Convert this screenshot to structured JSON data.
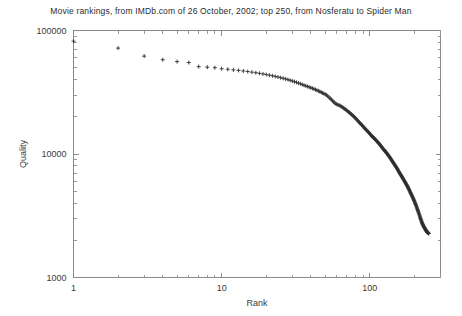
{
  "chart_data": {
    "type": "scatter",
    "title": "Movie rankings, from IMDb.com of 26 October, 2002; top 250, from Nosferatu to Spider Man",
    "xlabel": "Rank",
    "ylabel": "Quality",
    "xscale": "log",
    "yscale": "log",
    "xlim": [
      1,
      300
    ],
    "ylim": [
      1000,
      100000
    ],
    "xticks": [
      1,
      10,
      100
    ],
    "xtick_labels": [
      "1",
      "10",
      "100"
    ],
    "yticks": [
      1000,
      10000,
      100000
    ],
    "ytick_labels": [
      "1000",
      "10000",
      "100000"
    ],
    "grid": false,
    "legend": false,
    "marker": "plus",
    "marker_color": "#2e2e2e",
    "series_name": "Quality vs Rank",
    "x": [
      1,
      2,
      3,
      4,
      5,
      6,
      7,
      8,
      9,
      10,
      11,
      12,
      13,
      14,
      15,
      16,
      17,
      18,
      19,
      20,
      21,
      22,
      23,
      24,
      25,
      26,
      27,
      28,
      29,
      30,
      31,
      32,
      33,
      34,
      35,
      36,
      37,
      38,
      39,
      40,
      41,
      42,
      43,
      44,
      45,
      46,
      47,
      48,
      49,
      50,
      51,
      52,
      53,
      54,
      55,
      56,
      57,
      58,
      59,
      60,
      61,
      62,
      63,
      64,
      65,
      66,
      67,
      68,
      69,
      70,
      71,
      72,
      73,
      74,
      75,
      76,
      77,
      78,
      79,
      80,
      81,
      82,
      83,
      84,
      85,
      86,
      87,
      88,
      89,
      90,
      91,
      92,
      93,
      94,
      95,
      96,
      97,
      98,
      99,
      100,
      101,
      102,
      103,
      104,
      105,
      106,
      107,
      108,
      109,
      110,
      111,
      112,
      113,
      114,
      115,
      116,
      117,
      118,
      119,
      120,
      121,
      122,
      123,
      124,
      125,
      126,
      127,
      128,
      129,
      130,
      131,
      132,
      133,
      134,
      135,
      136,
      137,
      138,
      139,
      140,
      141,
      142,
      143,
      144,
      145,
      146,
      147,
      148,
      149,
      150,
      151,
      152,
      153,
      154,
      155,
      156,
      157,
      158,
      159,
      160,
      161,
      162,
      163,
      164,
      165,
      166,
      167,
      168,
      169,
      170,
      171,
      172,
      173,
      174,
      175,
      176,
      177,
      178,
      179,
      180,
      181,
      182,
      183,
      184,
      185,
      186,
      187,
      188,
      189,
      190,
      191,
      192,
      193,
      194,
      195,
      196,
      197,
      198,
      199,
      200,
      201,
      202,
      203,
      204,
      205,
      206,
      207,
      208,
      209,
      210,
      211,
      212,
      213,
      214,
      215,
      216,
      217,
      218,
      219,
      220,
      221,
      222,
      223,
      224,
      225,
      226,
      227,
      228,
      229,
      230,
      231,
      232,
      233,
      234,
      235,
      236,
      237,
      238,
      239,
      240,
      241,
      242,
      243,
      244,
      245,
      246,
      247,
      248,
      249,
      250
    ],
    "y": [
      82000,
      72000,
      62000,
      58000,
      56000,
      55000,
      51000,
      50500,
      50000,
      49000,
      48500,
      48000,
      47500,
      47000,
      46500,
      46000,
      45500,
      45000,
      44500,
      44000,
      43500,
      43000,
      42500,
      42000,
      41500,
      41000,
      40500,
      40000,
      39500,
      39000,
      38500,
      38000,
      37500,
      37000,
      36500,
      36000,
      35600,
      35200,
      34800,
      34400,
      34000,
      33600,
      33200,
      32800,
      32400,
      32000,
      31600,
      31200,
      30800,
      30400,
      30000,
      29400,
      28800,
      28200,
      27600,
      27000,
      26400,
      25900,
      25500,
      25200,
      25000,
      24800,
      24600,
      24300,
      24000,
      23700,
      23400,
      23100,
      22800,
      22500,
      22200,
      21900,
      21600,
      21300,
      21000,
      20700,
      20400,
      20100,
      19800,
      19500,
      19200,
      18900,
      18600,
      18300,
      18000,
      17750,
      17500,
      17250,
      17000,
      16750,
      16500,
      16250,
      16000,
      15800,
      15600,
      15400,
      15200,
      15000,
      14800,
      14600,
      14400,
      14200,
      14000,
      13850,
      13700,
      13550,
      13400,
      13250,
      13100,
      12950,
      12800,
      12650,
      12500,
      12350,
      12200,
      12050,
      11900,
      11750,
      11600,
      11450,
      11300,
      11150,
      11000,
      10880,
      10760,
      10640,
      10520,
      10400,
      10280,
      10160,
      10040,
      9920,
      9800,
      9680,
      9560,
      9440,
      9320,
      9200,
      9080,
      8960,
      8840,
      8720,
      8600,
      8500,
      8400,
      8300,
      8200,
      8100,
      8000,
      7900,
      7800,
      7700,
      7600,
      7500,
      7400,
      7300,
      7200,
      7100,
      7000,
      6920,
      6840,
      6760,
      6680,
      6600,
      6520,
      6440,
      6360,
      6280,
      6200,
      6130,
      6060,
      5990,
      5920,
      5850,
      5780,
      5710,
      5640,
      5570,
      5500,
      5430,
      5360,
      5290,
      5220,
      5150,
      5080,
      5010,
      4940,
      4870,
      4800,
      4740,
      4680,
      4620,
      4560,
      4500,
      4440,
      4380,
      4320,
      4260,
      4200,
      4140,
      4080,
      4020,
      3960,
      3900,
      3840,
      3780,
      3720,
      3660,
      3600,
      3545,
      3490,
      3435,
      3380,
      3325,
      3270,
      3215,
      3160,
      3105,
      3050,
      3000,
      2955,
      2910,
      2865,
      2820,
      2780,
      2745,
      2710,
      2680,
      2650,
      2620,
      2595,
      2570,
      2545,
      2520,
      2500,
      2480,
      2460,
      2440,
      2420,
      2400,
      2380,
      2360,
      2345,
      2330,
      2320,
      2310,
      2300,
      2290,
      2280,
      2270,
      2260,
      2250,
      2245,
      2240
    ]
  }
}
